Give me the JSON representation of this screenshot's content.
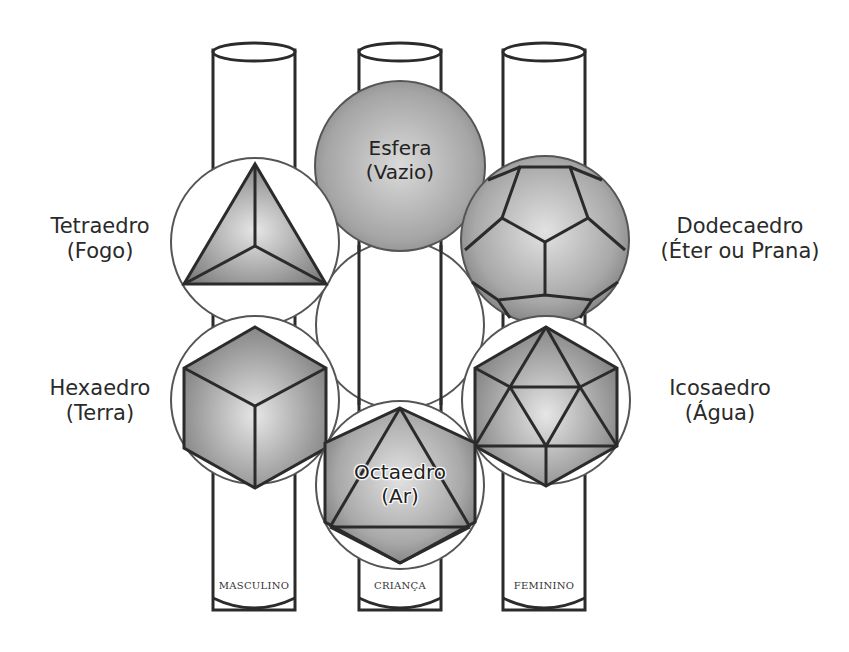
{
  "diagram": {
    "columns": [
      {
        "id": "left",
        "label": "MASCULINO"
      },
      {
        "id": "center",
        "label": "CRIANÇA"
      },
      {
        "id": "right",
        "label": "FEMININO"
      }
    ],
    "solids": {
      "sphere": {
        "name": "Esfera",
        "element": "(Vazio)"
      },
      "tetrahedron": {
        "name": "Tetraedro",
        "element": "(Fogo)"
      },
      "dodecahedron": {
        "name": "Dodecaedro",
        "element": "(Éter ou Prana)"
      },
      "hexahedron": {
        "name": "Hexaedro",
        "element": "(Terra)"
      },
      "icosahedron": {
        "name": "Icosaedro",
        "element": "(Água)"
      },
      "octahedron": {
        "name": "Octaedro",
        "element": "(Ar)"
      }
    },
    "colors": {
      "background": "#ffffff",
      "stroke": "#2b2b2b",
      "solid_fill_light": "#d9d9d9",
      "solid_fill_dark": "#8a8a8a"
    }
  }
}
